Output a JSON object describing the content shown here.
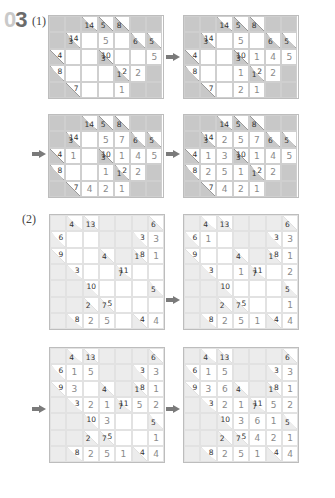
{
  "header": {
    "question_number": "03",
    "digit0": "0",
    "digit1": "3"
  },
  "parts": [
    {
      "label": "(1)"
    },
    {
      "label": "(2)"
    }
  ],
  "colors": {
    "block": "#c8c8c8",
    "block_light": "#ececec",
    "given_digit": "#8a8a8a",
    "clue": "#333333",
    "arrow": "#7a7a7a"
  },
  "puzzle1": {
    "rows": 5,
    "cols": 7,
    "layout": [
      [
        "B",
        "B",
        {
          "d": "14"
        },
        {
          "d": "5"
        },
        {
          "d": "8"
        },
        "B",
        "B"
      ],
      [
        "B",
        {
          "d": "3",
          "r": "14"
        },
        "W",
        "W",
        "W",
        {
          "d": "6"
        },
        {
          "d": "5"
        }
      ],
      [
        {
          "r": "4"
        },
        "W",
        "W",
        {
          "d": "3",
          "r": "10"
        },
        "W",
        "W",
        "W"
      ],
      [
        {
          "r": "8"
        },
        "W",
        "W",
        "W",
        {
          "d": "1",
          "r": "2"
        },
        "W",
        "B"
      ],
      [
        "B",
        {
          "r": "7"
        },
        "W",
        "W",
        "W",
        "B",
        "B"
      ]
    ],
    "steps": [
      [
        [
          "",
          "",
          "",
          "",
          "",
          "",
          ""
        ],
        [
          "",
          "",
          "",
          "5",
          "",
          "",
          ""
        ],
        [
          "",
          "",
          "",
          "",
          "",
          "",
          "5"
        ],
        [
          "",
          "",
          "",
          "",
          "",
          "2",
          ""
        ],
        [
          "",
          "",
          "",
          "",
          "1",
          "",
          ""
        ]
      ],
      [
        [
          "",
          "",
          "",
          "",
          "",
          "",
          ""
        ],
        [
          "",
          "",
          "",
          "5",
          "",
          "",
          ""
        ],
        [
          "",
          "",
          "",
          "",
          "1",
          "4",
          "5"
        ],
        [
          "",
          "",
          "",
          "1",
          "",
          "2",
          ""
        ],
        [
          "",
          "",
          "",
          "2",
          "1",
          "",
          ""
        ]
      ],
      [
        [
          "",
          "",
          "",
          "",
          "",
          "",
          ""
        ],
        [
          "",
          "",
          "",
          "5",
          "7",
          "",
          ""
        ],
        [
          "",
          "1",
          "",
          "",
          "1",
          "4",
          "5"
        ],
        [
          "",
          "",
          "",
          "1",
          "",
          "2",
          ""
        ],
        [
          "",
          "",
          "4",
          "2",
          "1",
          "",
          ""
        ]
      ],
      [
        [
          "",
          "",
          "",
          "",
          "",
          "",
          ""
        ],
        [
          "",
          "",
          "2",
          "5",
          "7",
          "",
          ""
        ],
        [
          "",
          "1",
          "3",
          "",
          "1",
          "4",
          "5"
        ],
        [
          "",
          "2",
          "5",
          "1",
          "",
          "2",
          ""
        ],
        [
          "",
          "",
          "4",
          "2",
          "1",
          "",
          ""
        ]
      ]
    ]
  },
  "puzzle2": {
    "rows": 7,
    "cols": 7,
    "layout": [
      [
        "B",
        {
          "d": "4"
        },
        {
          "d": "13"
        },
        "B",
        "B",
        "B",
        {
          "d": "6"
        }
      ],
      [
        {
          "r": "6"
        },
        "W",
        "W",
        "B",
        "B",
        {
          "r": "3"
        },
        "W"
      ],
      [
        {
          "r": "9"
        },
        "W",
        "W",
        {
          "d": "4"
        },
        "B",
        {
          "d": "1",
          "r": "8"
        },
        "W"
      ],
      [
        "B",
        {
          "r": "3"
        },
        "W",
        "W",
        {
          "d": "7",
          "r": "11"
        },
        "W",
        "W"
      ],
      [
        "B",
        "B",
        {
          "r": "10"
        },
        "W",
        "W",
        "W",
        {
          "d": "5"
        }
      ],
      [
        "B",
        "B",
        {
          "d": "2"
        },
        {
          "d": "7",
          "r": "5"
        },
        "W",
        "W",
        "W"
      ],
      [
        "B",
        {
          "r": "8"
        },
        "W",
        "W",
        "W",
        {
          "r": "4"
        },
        "W"
      ]
    ],
    "steps": [
      [
        [
          "",
          "",
          "",
          "",
          "",
          "",
          ""
        ],
        [
          "",
          "",
          "",
          "",
          "",
          "",
          "3"
        ],
        [
          "",
          "",
          "",
          "",
          "",
          "",
          "1"
        ],
        [
          "",
          "",
          "",
          "",
          "",
          "",
          ""
        ],
        [
          "",
          "",
          "",
          "",
          "",
          "",
          ""
        ],
        [
          "",
          "",
          "",
          "",
          "",
          "",
          ""
        ],
        [
          "",
          "",
          "2",
          "5",
          "",
          "",
          "4"
        ]
      ],
      [
        [
          "",
          "",
          "",
          "",
          "",
          "",
          ""
        ],
        [
          "",
          "1",
          "",
          "",
          "",
          "",
          "3"
        ],
        [
          "",
          "",
          "",
          "",
          "",
          "",
          "1"
        ],
        [
          "",
          "",
          "",
          "1",
          "",
          "",
          "2"
        ],
        [
          "",
          "",
          "",
          "",
          "",
          "",
          ""
        ],
        [
          "",
          "",
          "",
          "",
          "",
          "",
          "1"
        ],
        [
          "",
          "",
          "2",
          "5",
          "1",
          "",
          "4"
        ]
      ],
      [
        [
          "",
          "",
          "",
          "",
          "",
          "",
          ""
        ],
        [
          "",
          "1",
          "5",
          "",
          "",
          "",
          "3"
        ],
        [
          "",
          "3",
          "",
          "",
          "",
          "",
          "1"
        ],
        [
          "",
          "",
          "2",
          "1",
          "",
          "5",
          "2"
        ],
        [
          "",
          "",
          "",
          "3",
          "",
          "",
          ""
        ],
        [
          "",
          "",
          "",
          "",
          "",
          "",
          "1"
        ],
        [
          "",
          "",
          "2",
          "5",
          "1",
          "",
          "4"
        ]
      ],
      [
        [
          "",
          "",
          "",
          "",
          "",
          "",
          ""
        ],
        [
          "",
          "1",
          "5",
          "",
          "",
          "",
          "3"
        ],
        [
          "",
          "3",
          "6",
          "",
          "",
          "",
          "1"
        ],
        [
          "",
          "",
          "2",
          "1",
          "",
          "5",
          "2"
        ],
        [
          "",
          "",
          "",
          "3",
          "6",
          "1",
          ""
        ],
        [
          "",
          "",
          "",
          "",
          "4",
          "2",
          "1"
        ],
        [
          "",
          "",
          "2",
          "5",
          "1",
          "",
          "4"
        ]
      ]
    ]
  },
  "icons": {
    "arrow": "right-arrow-icon"
  }
}
